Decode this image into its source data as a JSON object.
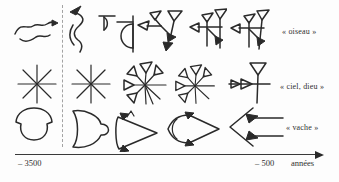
{
  "figure": {
    "description_rows": [
      {
        "label": "« oiseau »",
        "glyphs": [
          "bird-pictograph",
          "bird-rotated-pictograph",
          "bird-early-cuneiform",
          "bird-cuneiform-1",
          "bird-cuneiform-2",
          "bird-cuneiform-3"
        ]
      },
      {
        "label": "« ciel, dieu »",
        "glyphs": [
          "star-pictograph",
          "star-rotated-pictograph",
          "star-wedge-cuneiform-1",
          "star-wedge-cuneiform-2",
          "dingir-late-cuneiform"
        ]
      },
      {
        "label": "« vache »",
        "glyphs": [
          "cow-head-pictograph",
          "cow-head-rotated-pictograph",
          "cow-head-early-cuneiform",
          "cow-head-cuneiform",
          "cow-head-late-cuneiform"
        ]
      }
    ],
    "timeline": {
      "start": "– 3500",
      "end": "– 500",
      "unit": "années"
    }
  },
  "colors": {
    "ink": "#2a2a2a",
    "background": "#fdfdfd",
    "divider": "#a3a3a3"
  }
}
